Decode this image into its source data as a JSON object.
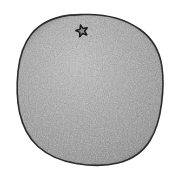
{
  "image": {
    "kind": "specimen-photograph",
    "subject": "irregular rounded stone disc artifact",
    "background_color": "#ffffff",
    "width": 181,
    "height": 180,
    "caption": ""
  },
  "specimen": {
    "name": "rounded stone disc",
    "outline_color": "#2b2b2b",
    "outline_width": 1.6,
    "fill_base_color": "#9a9a9a",
    "fill_light_color": "#b4b4b4",
    "fill_dark_color": "#7c7c7c",
    "shadow_color": "#5e5e5e",
    "texture": "fine speckled granular noise",
    "bounds": {
      "left": 17,
      "top": 14,
      "right": 163,
      "bottom": 165
    },
    "outline_path": "M 84 14.5 C 106 13.8 126 19.5 140 29.5 C 152.5 38.5 159.5 51 161.8 66 C 163.6 78 163.2 91 161.5 104 C 159.8 117.5 156.5 130 150 140.5 C 143 152 132 159.5 118 163 C 105 166.2 90 165.8 76 163.5 C 61 161 48 155.5 38 146.5 C 28.5 138 22.5 126 19.5 112 C 16.8 99 16.6 85 18 71.5 C 19.5 57 23.5 44 31.5 34 C 40 23.5 53 17.5 68 15.4 C 73.5 14.7 79 14.7 84 14.5 Z"
  },
  "marking": {
    "name": "five-pointed star",
    "type": "star",
    "points": 5,
    "stroke_color": "#1a1a1a",
    "fill_color": "#8f8f8f",
    "center_x": 82,
    "center_y": 31,
    "outer_radius": 6.2,
    "inner_radius": 2.6,
    "rotation_deg": -14
  },
  "palette": {
    "white": "#ffffff",
    "outline": "#2b2b2b",
    "mid_gray": "#9a9a9a",
    "light_gray": "#b8b8b8",
    "dark_gray": "#767676"
  }
}
